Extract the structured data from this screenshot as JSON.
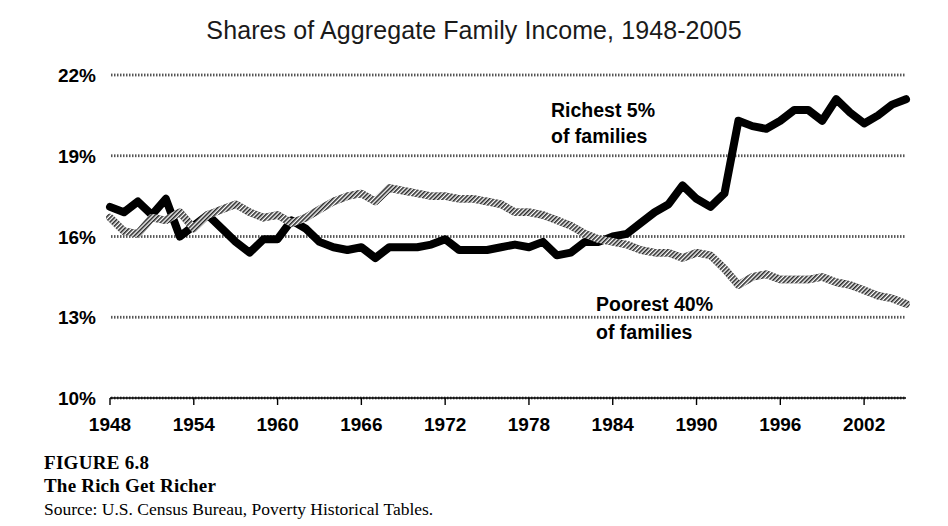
{
  "figure": {
    "title": "Shares of Aggregate Family Income, 1948-2005",
    "caption_number": "FIGURE 6.8",
    "caption_title": "The Rich Get Richer",
    "caption_source": "Source: U.S. Census Bureau, Poverty Historical Tables."
  },
  "annotations": {
    "richest_line1": "Richest 5%",
    "richest_line2": "of families",
    "poorest_line1": "Poorest 40%",
    "poorest_line2": "of families"
  },
  "chart_data": {
    "type": "line",
    "title": "Shares of Aggregate Family Income, 1948-2005",
    "xlabel": "",
    "ylabel": "",
    "xlim": [
      1948,
      2005
    ],
    "ylim": [
      10,
      22
    ],
    "grid": true,
    "legend_position": "inline-annotations",
    "y_ticks": [
      10,
      13,
      16,
      19,
      22
    ],
    "y_tick_labels": [
      "10%",
      "13%",
      "16%",
      "19%",
      "22%"
    ],
    "x_ticks": [
      1948,
      1954,
      1960,
      1966,
      1972,
      1978,
      1984,
      1990,
      1996,
      2002
    ],
    "x_tick_labels": [
      "1948",
      "1954",
      "1960",
      "1966",
      "1972",
      "1978",
      "1984",
      "1990",
      "1996",
      "2002"
    ],
    "x": [
      1948,
      1949,
      1950,
      1951,
      1952,
      1953,
      1954,
      1955,
      1956,
      1957,
      1958,
      1959,
      1960,
      1961,
      1962,
      1963,
      1964,
      1965,
      1966,
      1967,
      1968,
      1969,
      1970,
      1971,
      1972,
      1973,
      1974,
      1975,
      1976,
      1977,
      1978,
      1979,
      1980,
      1981,
      1982,
      1983,
      1984,
      1985,
      1986,
      1987,
      1988,
      1989,
      1990,
      1991,
      1992,
      1993,
      1994,
      1995,
      1996,
      1997,
      1998,
      1999,
      2000,
      2001,
      2002,
      2003,
      2004,
      2005
    ],
    "series": [
      {
        "name": "Richest 5% of families",
        "style": "solid-black",
        "color": "#000000",
        "values": [
          17.1,
          16.9,
          17.3,
          16.8,
          17.4,
          16.0,
          16.4,
          16.8,
          16.3,
          15.8,
          15.4,
          15.9,
          15.9,
          16.6,
          16.3,
          15.8,
          15.6,
          15.5,
          15.6,
          15.2,
          15.6,
          15.6,
          15.6,
          15.7,
          15.9,
          15.5,
          15.5,
          15.5,
          15.6,
          15.7,
          15.6,
          15.8,
          15.3,
          15.4,
          15.8,
          15.8,
          16.0,
          16.1,
          16.5,
          16.9,
          17.2,
          17.9,
          17.4,
          17.1,
          17.6,
          20.3,
          20.1,
          20.0,
          20.3,
          20.7,
          20.7,
          20.3,
          21.1,
          20.6,
          20.2,
          20.5,
          20.9,
          21.1
        ]
      },
      {
        "name": "Poorest 40% of families",
        "style": "hatched-gray",
        "color": "#555555",
        "values": [
          16.7,
          16.2,
          16.1,
          16.7,
          16.6,
          16.9,
          16.3,
          16.8,
          17.0,
          17.2,
          16.9,
          16.7,
          16.8,
          16.5,
          16.7,
          17.0,
          17.3,
          17.5,
          17.6,
          17.3,
          17.8,
          17.7,
          17.6,
          17.5,
          17.5,
          17.4,
          17.4,
          17.3,
          17.2,
          16.9,
          16.9,
          16.8,
          16.6,
          16.4,
          16.1,
          15.9,
          15.8,
          15.7,
          15.5,
          15.4,
          15.4,
          15.2,
          15.4,
          15.3,
          14.8,
          14.2,
          14.5,
          14.6,
          14.4,
          14.4,
          14.4,
          14.5,
          14.3,
          14.2,
          14.0,
          13.8,
          13.7,
          13.5
        ]
      }
    ]
  }
}
